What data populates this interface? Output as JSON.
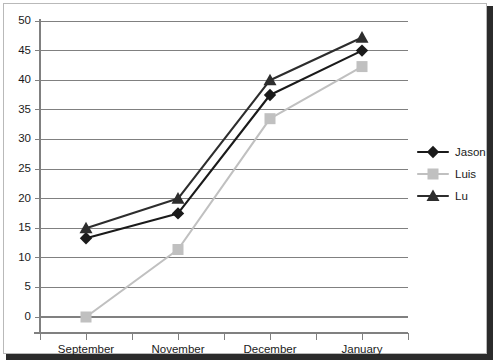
{
  "chart_data": {
    "type": "line",
    "title": "",
    "xlabel": "",
    "ylabel": "",
    "categories": [
      "September",
      "November",
      "December",
      "January"
    ],
    "ylim": [
      0,
      50
    ],
    "yticks": [
      0,
      5,
      10,
      15,
      20,
      25,
      30,
      35,
      40,
      45,
      50
    ],
    "ytick_labels": [
      "0",
      "5",
      "10",
      "15",
      "20",
      "25",
      "30",
      "35",
      "40",
      "45",
      "50"
    ],
    "grid": true,
    "grid_axis": "y",
    "legend_position": "right",
    "series": [
      {
        "name": "Jason",
        "values": [
          13.3,
          17.5,
          37.5,
          45.0
        ],
        "color": "#1a1a1a",
        "marker": "diamond"
      },
      {
        "name": "Luis",
        "values": [
          0.0,
          11.4,
          33.5,
          42.3
        ],
        "color": "#c0c0c0",
        "marker": "square"
      },
      {
        "name": "Lu",
        "values": [
          15.0,
          20.0,
          40.0,
          47.2
        ],
        "color": "#2d2d2d",
        "marker": "triangle"
      }
    ]
  },
  "figure": {
    "background_color": "#ffffff",
    "border_color": "#b9b9b9",
    "shadow_color": "#2b2b2b",
    "gridline_color": "#808080",
    "axis_color": "#808080"
  }
}
